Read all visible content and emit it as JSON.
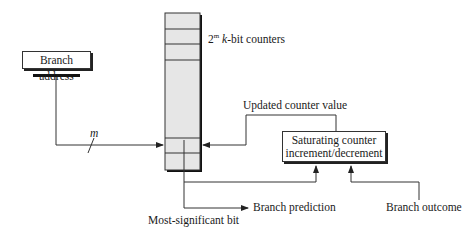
{
  "diagram": {
    "nodes": {
      "branch_address": "Branch address",
      "counter_table_label_base": "2",
      "counter_table_label_sup": "m",
      "counter_table_label_k": "k",
      "counter_table_label_rest": "-bit counters",
      "saturating_counter_line1": "Saturating counter",
      "saturating_counter_line2": "increment/decrement"
    },
    "edges": {
      "index_bits": "m",
      "updated_value": "Updated counter value",
      "msb": "Most-significant bit",
      "prediction": "Branch prediction",
      "outcome": "Branch outcome"
    },
    "colors": {
      "table_fill": "#e6e6e6",
      "line": "#222222",
      "shadow": "#111111"
    }
  }
}
